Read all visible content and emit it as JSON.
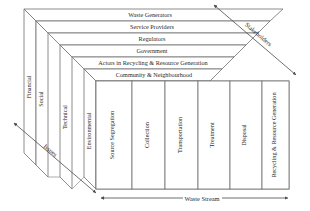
{
  "diagram": {
    "colors": {
      "edge": "#6f6f6f",
      "edge_light": "#8a8a8a",
      "text": "#2b2b2b",
      "arrow": "#4a4a4a",
      "background": "#ffffff"
    },
    "top_face": {
      "axis_label": "Stakeholders",
      "rows": [
        {
          "label": "Waste Generators"
        },
        {
          "label": "Service Providers"
        },
        {
          "label": "Regulators"
        },
        {
          "label": "Government"
        },
        {
          "label": "Actors in Recycling & Resource Generation"
        },
        {
          "label": "Community & Neighbourhood"
        }
      ]
    },
    "front_face": {
      "axis_label": "Waste Stream",
      "panels": [
        {
          "label": "Source Segregation"
        },
        {
          "label": "Collection"
        },
        {
          "label": "Transportation"
        },
        {
          "label": "Treatment"
        },
        {
          "label": "Disposal"
        },
        {
          "label": "Recycling & Resource Generation"
        }
      ]
    },
    "left_face": {
      "axis_label": "Issues",
      "panels": [
        {
          "label": "Financial"
        },
        {
          "label": "Social"
        },
        {
          "label": "Technical"
        },
        {
          "label": "Environmental"
        }
      ]
    }
  }
}
